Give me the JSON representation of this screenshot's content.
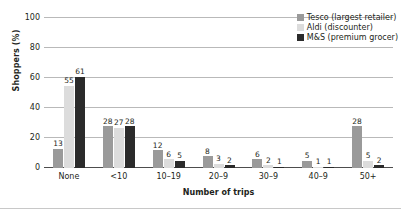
{
  "chart_data": {
    "type": "bar",
    "title": "",
    "xlabel": "Number of trips",
    "ylabel": "Shoppers (%)",
    "categories": [
      "None",
      "<10",
      "10–19",
      "20–9",
      "30–9",
      "40–9",
      "50+"
    ],
    "series": [
      {
        "name": "Tesco (largest retailer)",
        "color": "#9a9a9a",
        "values": [
          13,
          28,
          12,
          8,
          6,
          5,
          28
        ]
      },
      {
        "name": "Aldi (discounter)",
        "color": "#dcdcdc",
        "values": [
          55,
          27,
          6,
          3,
          2,
          1,
          5
        ]
      },
      {
        "name": "M&S (premium grocer)",
        "color": "#2b2b2b",
        "values": [
          61,
          28,
          5,
          2,
          1,
          1,
          2
        ]
      }
    ],
    "ylim": [
      0,
      100
    ],
    "yticks": [
      0,
      20,
      40,
      60,
      80,
      100
    ],
    "ytick_labels": [
      "0",
      "20",
      "40",
      "60",
      "80",
      "100"
    ],
    "grid": true,
    "data_labels": true,
    "legend_position": "top-right"
  }
}
